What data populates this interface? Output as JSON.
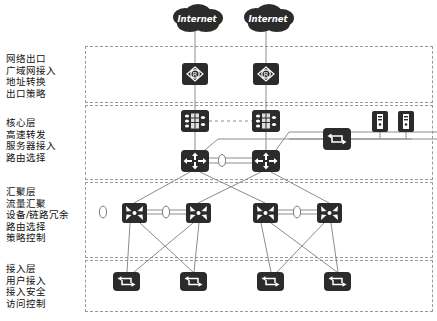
{
  "diagram": {
    "background": "#ffffff",
    "device_color": "#2b2b2b",
    "link_color": "#8c8c8c",
    "zone_border_color": "#9a9a9a",
    "text_color": "#111111"
  },
  "layers": [
    {
      "id": "egress",
      "name": "网络出口",
      "lines": [
        "网络出口",
        "广域网接入",
        "地址转换",
        "出口策略"
      ]
    },
    {
      "id": "core",
      "name": "核心层",
      "lines": [
        "核心层",
        "高速转发",
        "服务器接入",
        "路由选择"
      ]
    },
    {
      "id": "aggregation",
      "name": "汇聚层",
      "lines": [
        "汇聚层",
        "流量汇聚",
        "设备/链路冗余",
        "路由选择",
        "策略控制"
      ]
    },
    {
      "id": "access",
      "name": "接入层",
      "lines": [
        "接入层",
        "用户接入",
        "接入安全",
        "访问控制"
      ]
    }
  ],
  "clouds": [
    {
      "label": "Internet",
      "x": 168,
      "y": 4
    },
    {
      "label": "Internet",
      "x": 239,
      "y": 4
    }
  ],
  "devices": {
    "routers": [
      {
        "icon": "router-icon",
        "x": 182,
        "y": 63
      },
      {
        "icon": "router-icon",
        "x": 253,
        "y": 63
      }
    ],
    "firewalls": [
      {
        "icon": "firewall-icon",
        "x": 181,
        "y": 110
      },
      {
        "icon": "firewall-icon",
        "x": 252,
        "y": 110
      }
    ],
    "core_switches": [
      {
        "icon": "layer3-switch-icon",
        "x": 181,
        "y": 150
      },
      {
        "icon": "layer3-switch-icon",
        "x": 252,
        "y": 150
      }
    ],
    "server_switch": {
      "icon": "switch-icon",
      "x": 323,
      "y": 128
    },
    "servers": [
      {
        "icon": "server-icon",
        "x": 372,
        "y": 111
      },
      {
        "icon": "server-icon",
        "x": 398,
        "y": 111
      }
    ],
    "aggregation_switches": [
      {
        "icon": "aggregation-switch-icon",
        "x": 122,
        "y": 203
      },
      {
        "icon": "aggregation-switch-icon",
        "x": 186,
        "y": 203
      },
      {
        "icon": "aggregation-switch-icon",
        "x": 253,
        "y": 203
      },
      {
        "icon": "aggregation-switch-icon",
        "x": 317,
        "y": 203
      }
    ],
    "access_switches": [
      {
        "icon": "switch-icon",
        "x": 113,
        "y": 272
      },
      {
        "icon": "switch-icon",
        "x": 180,
        "y": 272
      },
      {
        "icon": "switch-icon",
        "x": 257,
        "y": 272
      },
      {
        "icon": "switch-icon",
        "x": 324,
        "y": 272
      }
    ],
    "link_markers": [
      {
        "icon": "link-oval-icon",
        "x": 215,
        "y": 155
      },
      {
        "icon": "link-oval-icon",
        "x": 156,
        "y": 208
      },
      {
        "icon": "link-oval-icon",
        "x": 287,
        "y": 208
      }
    ]
  },
  "zones": [
    {
      "id": "egress-zone",
      "x": 85,
      "y": 46,
      "w": 348,
      "h": 57
    },
    {
      "id": "core-zone",
      "x": 85,
      "y": 105,
      "w": 348,
      "h": 75
    },
    {
      "id": "aggregation-zone",
      "x": 85,
      "y": 182,
      "w": 348,
      "h": 76
    },
    {
      "id": "access-zone",
      "x": 85,
      "y": 260,
      "w": 348,
      "h": 52
    }
  ]
}
